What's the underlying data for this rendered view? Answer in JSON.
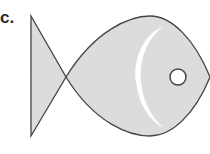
{
  "figure": {
    "label": "c.",
    "parts": [
      "tail",
      "body",
      "gill-line",
      "eye"
    ],
    "colors": {
      "fill": "#dcdcdc",
      "outline": "#444444",
      "gill": "#ffffff",
      "eye_fill": "#ffffff",
      "background": "#ffffff"
    }
  }
}
